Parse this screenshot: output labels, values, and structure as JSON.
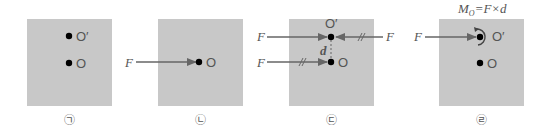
{
  "panels": [
    {
      "id": "a",
      "caption": "㉠",
      "point_upper": "O′",
      "point_lower": "O"
    },
    {
      "id": "b",
      "caption": "㉡",
      "force": "F",
      "point_lower": "O"
    },
    {
      "id": "c",
      "caption": "㉢",
      "force_left_upper": "F",
      "force_left_lower": "F",
      "force_right_upper": "F",
      "distance": "d",
      "point_upper": "O′",
      "point_lower": "O"
    },
    {
      "id": "d",
      "caption": "㉣",
      "force": "F",
      "point_upper": "O′",
      "point_lower": "O",
      "moment_formula": "M",
      "moment_sub": "O",
      "moment_rhs": "=F×d"
    }
  ],
  "colors": {
    "panel_fill": "#c8c8c8",
    "arrow": "#666666",
    "dot": "#000000",
    "text": "#555555"
  }
}
